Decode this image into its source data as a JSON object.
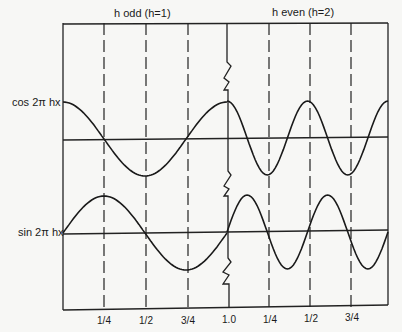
{
  "headers": {
    "left": "h odd (h=1)",
    "right": "h even (h=2)"
  },
  "curves": {
    "cos_label": "cos 2π hx",
    "sin_label": "sin 2π hx"
  },
  "ticks": [
    "1/4",
    "1/2",
    "3/4",
    "1.0",
    "1/4",
    "1/2",
    "3/4"
  ],
  "chart_data": {
    "type": "line",
    "title": "",
    "panels": [
      {
        "name": "h odd (h=1)",
        "h": 1,
        "x_range": [
          0,
          1
        ],
        "series": [
          {
            "name": "cos 2π hx"
          },
          {
            "name": "sin 2π hx"
          }
        ]
      },
      {
        "name": "h even (h=2)",
        "h": 2,
        "x_range": [
          0,
          1
        ],
        "series": [
          {
            "name": "cos 2π hx"
          },
          {
            "name": "sin 2π hx"
          }
        ]
      }
    ],
    "xticks": [
      "1/4",
      "1/2",
      "3/4",
      "1.0",
      "1/4",
      "1/2",
      "3/4"
    ],
    "grid": "dashed vertical lines at quarter periods"
  }
}
